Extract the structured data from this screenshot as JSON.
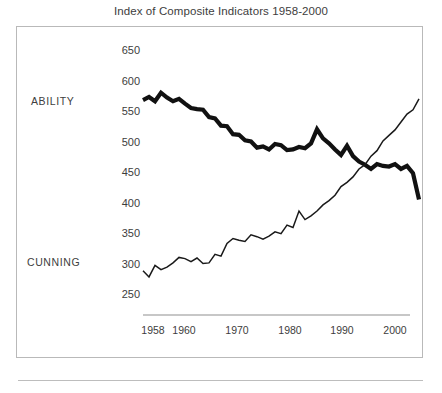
{
  "chart_data": {
    "type": "line",
    "title": "Index of Composite Indicators 1958-2000",
    "xlabel": "",
    "ylabel": "",
    "xlim": [
      1957,
      2005
    ],
    "ylim": [
      240,
      670
    ],
    "grid": false,
    "legend_position": "inline-left",
    "y_ticks": [
      "650",
      "600",
      "550",
      "500",
      "450",
      "400",
      "350",
      "300",
      "250"
    ],
    "y_tick_values": [
      650,
      600,
      550,
      500,
      450,
      400,
      350,
      300,
      250
    ],
    "x_ticks": [
      "1958",
      "1960",
      "1970",
      "1980",
      "1990",
      "2000"
    ],
    "x_tick_values": [
      1958,
      1960,
      1970,
      1980,
      1990,
      2000
    ],
    "x": [
      1958,
      1959,
      1960,
      1961,
      1962,
      1963,
      1964,
      1965,
      1966,
      1967,
      1968,
      1969,
      1970,
      1971,
      1972,
      1973,
      1974,
      1975,
      1976,
      1977,
      1978,
      1979,
      1980,
      1981,
      1982,
      1983,
      1984,
      1985,
      1986,
      1987,
      1988,
      1989,
      1990,
      1991,
      1992,
      1993,
      1994,
      1995,
      1996,
      1997,
      1998,
      1999,
      2000,
      2001,
      2002,
      2003,
      2004
    ],
    "series": [
      {
        "name": "ABILITY",
        "style": "thick",
        "color": "#111111",
        "values": [
          568,
          573,
          566,
          580,
          572,
          566,
          570,
          562,
          555,
          553,
          552,
          540,
          538,
          526,
          525,
          512,
          511,
          502,
          500,
          490,
          492,
          487,
          496,
          494,
          486,
          487,
          491,
          489,
          497,
          520,
          505,
          497,
          487,
          478,
          493,
          476,
          467,
          462,
          455,
          463,
          460,
          459,
          463,
          455,
          460,
          448,
          405
        ]
      },
      {
        "name": "CUNNING",
        "style": "thin",
        "color": "#1a1a1a",
        "values": [
          288,
          278,
          297,
          290,
          294,
          301,
          310,
          308,
          303,
          309,
          300,
          301,
          315,
          312,
          333,
          341,
          338,
          336,
          347,
          344,
          340,
          345,
          352,
          349,
          363,
          359,
          386,
          372,
          378,
          386,
          396,
          403,
          412,
          426,
          433,
          442,
          455,
          462,
          476,
          485,
          501,
          510,
          519,
          532,
          545,
          552,
          570
        ]
      }
    ]
  }
}
